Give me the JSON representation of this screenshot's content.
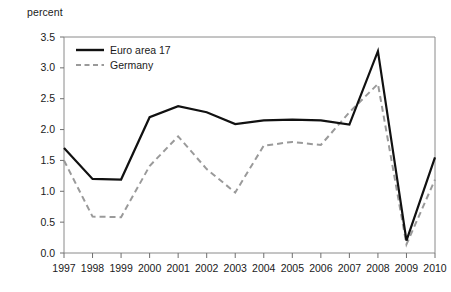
{
  "chart_data": {
    "type": "line",
    "title": "",
    "subtitle": "",
    "xlabel": "",
    "ylabel": "percent",
    "axis_unit_label": "percent",
    "categories": [
      "1997",
      "1998",
      "1999",
      "2000",
      "2001",
      "2002",
      "2003",
      "2004",
      "2005",
      "2006",
      "2007",
      "2008",
      "2009",
      "2010"
    ],
    "xlim": [
      1997,
      2010
    ],
    "ylim": [
      0.0,
      3.5
    ],
    "yticks": [
      "0.0",
      "0.5",
      "1.0",
      "1.5",
      "2.0",
      "2.5",
      "3.0",
      "3.5"
    ],
    "ytick_values": [
      0.0,
      0.5,
      1.0,
      1.5,
      2.0,
      2.5,
      3.0,
      3.5
    ],
    "grid": false,
    "legend_position": "top-left inside plot",
    "series": [
      {
        "name": "Euro area 17",
        "style": "solid",
        "color": "#111111",
        "values": [
          1.7,
          1.2,
          1.19,
          2.2,
          2.38,
          2.28,
          2.09,
          2.15,
          2.16,
          2.15,
          2.08,
          3.27,
          0.2,
          1.55
        ]
      },
      {
        "name": "Germany",
        "style": "dashed",
        "color": "#9a9a9a",
        "values": [
          1.5,
          0.59,
          0.58,
          1.41,
          1.89,
          1.36,
          0.98,
          1.74,
          1.8,
          1.75,
          2.28,
          2.74,
          0.14,
          1.19
        ]
      }
    ]
  },
  "legend": {
    "items": [
      {
        "label": "Euro area 17",
        "icon": "solid-line-swatch"
      },
      {
        "label": "Germany",
        "icon": "dashed-line-swatch"
      }
    ]
  }
}
